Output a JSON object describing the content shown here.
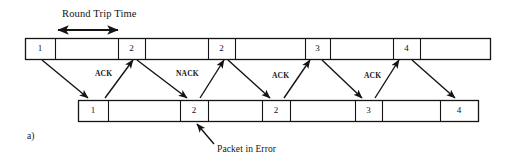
{
  "figure": {
    "part_label": "a)",
    "round_trip_label": "Round Trip Time",
    "packet_error_label": "Packet in Error",
    "colors": {
      "line": "#141414",
      "text": "#141414",
      "background": "#ffffff"
    },
    "sender_timeline": {
      "name": "sender-timeline",
      "x": 25,
      "y": 38,
      "width": 465,
      "height": 21,
      "cells": [
        {
          "label": "1",
          "x": 25,
          "width": 30
        },
        {
          "label": "",
          "x": 55,
          "width": 63
        },
        {
          "label": "2",
          "x": 118,
          "width": 27
        },
        {
          "label": "",
          "x": 145,
          "width": 63
        },
        {
          "label": "2",
          "x": 208,
          "width": 27
        },
        {
          "label": "",
          "x": 235,
          "width": 70
        },
        {
          "label": "3",
          "x": 305,
          "width": 25
        },
        {
          "label": "",
          "x": 330,
          "width": 63
        },
        {
          "label": "4",
          "x": 393,
          "width": 27
        },
        {
          "label": "",
          "x": 420,
          "width": 70
        }
      ]
    },
    "receiver_timeline": {
      "name": "receiver-timeline",
      "x": 78,
      "y": 100,
      "width": 400,
      "height": 21,
      "cells": [
        {
          "label": "1",
          "x": 78,
          "width": 30
        },
        {
          "label": "",
          "x": 108,
          "width": 72
        },
        {
          "label": "2",
          "x": 180,
          "width": 28
        },
        {
          "label": "",
          "x": 208,
          "width": 54
        },
        {
          "label": "2",
          "x": 262,
          "width": 28
        },
        {
          "label": "",
          "x": 290,
          "width": 65
        },
        {
          "label": "3",
          "x": 355,
          "width": 27
        },
        {
          "label": "",
          "x": 382,
          "width": 58
        },
        {
          "label": "4",
          "x": 440,
          "width": 38
        }
      ]
    },
    "round_trip_arrow": {
      "x1": 58,
      "x2": 118,
      "y": 30
    },
    "ack_labels": [
      {
        "text": "ACK",
        "x": 95,
        "y": 70
      },
      {
        "text": "NACK",
        "x": 176,
        "y": 70
      },
      {
        "text": "ACK",
        "x": 272,
        "y": 72
      },
      {
        "text": "ACK",
        "x": 364,
        "y": 72
      }
    ],
    "transmission_arrows": [
      {
        "name": "data-arrow-1",
        "x1": 42,
        "y1": 60,
        "x2": 88,
        "y2": 98
      },
      {
        "name": "ack-arrow-1",
        "x1": 105,
        "y1": 98,
        "x2": 133,
        "y2": 60
      },
      {
        "name": "data-arrow-2",
        "x1": 137,
        "y1": 60,
        "x2": 187,
        "y2": 98
      },
      {
        "name": "nack-arrow-1",
        "x1": 200,
        "y1": 98,
        "x2": 224,
        "y2": 60
      },
      {
        "name": "data-arrow-3",
        "x1": 228,
        "y1": 60,
        "x2": 270,
        "y2": 98
      },
      {
        "name": "ack-arrow-2",
        "x1": 284,
        "y1": 98,
        "x2": 310,
        "y2": 60
      },
      {
        "name": "data-arrow-4",
        "x1": 322,
        "y1": 60,
        "x2": 362,
        "y2": 98
      },
      {
        "name": "ack-arrow-3",
        "x1": 375,
        "y1": 98,
        "x2": 399,
        "y2": 60
      },
      {
        "name": "data-arrow-5",
        "x1": 412,
        "y1": 60,
        "x2": 455,
        "y2": 98
      }
    ],
    "packet_error_pointer": {
      "x1": 214,
      "y1": 144,
      "x2": 197,
      "y2": 124
    }
  }
}
